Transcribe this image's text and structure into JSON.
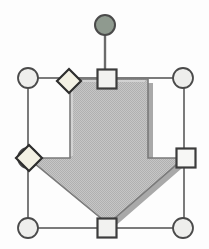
{
  "canvas": {
    "width": 209,
    "height": 249,
    "background_color": "#fdfdfd",
    "label": "drawing-canvas"
  },
  "shape": {
    "name": "down-arrow",
    "type": "autoshape",
    "state": "selected",
    "fill_color": "#bdbdbd",
    "fill_pattern": "dither-halftone-gray",
    "outline_color": "#7a7a7a",
    "shadow_color": "#8c8c8c",
    "highlight_color": "#d6d6d6",
    "geometry": {
      "bounds": {
        "x": 28,
        "y": 78,
        "width": 156,
        "height": 150
      },
      "shaft_left": 70,
      "shaft_right": 148,
      "shoulder_y": 158,
      "tip_x": 108,
      "tip_y": 224,
      "head_left": 28,
      "head_right": 184,
      "top_y": 79
    }
  },
  "selection": {
    "label": "selection-frame",
    "line_color": "#5a5a5a",
    "bounds": {
      "x": 28,
      "y": 78,
      "width": 156,
      "height": 150
    },
    "rotation_handle": {
      "name": "rotation-handle",
      "shape": "circle",
      "fill_color": "#8f9a8f",
      "outline_color": "#4a4a4a",
      "cx": 105,
      "cy": 25,
      "r": 10,
      "stem_from_y": 35,
      "stem_to_y": 79
    },
    "resize_handles": [
      {
        "name": "resize-handle-top-left",
        "shape": "circle",
        "cx": 28,
        "cy": 78,
        "r": 10,
        "fill_color": "#eeeeec",
        "outline_color": "#4a4a4a"
      },
      {
        "name": "resize-handle-top-center",
        "shape": "square",
        "cx": 107,
        "cy": 79,
        "size": 19,
        "fill_color": "#f2f2f0",
        "outline_color": "#3c3c3c"
      },
      {
        "name": "resize-handle-top-right",
        "shape": "circle",
        "cx": 183,
        "cy": 78,
        "r": 10,
        "fill_color": "#eeeeec",
        "outline_color": "#4a4a4a"
      },
      {
        "name": "resize-handle-middle-right",
        "shape": "square",
        "cx": 186,
        "cy": 158,
        "size": 19,
        "fill_color": "#f7f7f5",
        "outline_color": "#3c3c3c"
      },
      {
        "name": "resize-handle-bottom-right",
        "shape": "circle",
        "cx": 183,
        "cy": 228,
        "r": 10,
        "fill_color": "#eeeeec",
        "outline_color": "#4a4a4a"
      },
      {
        "name": "resize-handle-bottom-center",
        "shape": "square",
        "cx": 107,
        "cy": 228,
        "size": 19,
        "fill_color": "#f2f2f0",
        "outline_color": "#3c3c3c"
      },
      {
        "name": "resize-handle-bottom-left",
        "shape": "circle",
        "cx": 28,
        "cy": 228,
        "r": 10,
        "fill_color": "#eeeeec",
        "outline_color": "#4a4a4a"
      },
      {
        "name": "resize-handle-middle-left",
        "shape": "circle",
        "cx": 28,
        "cy": 158,
        "r": 10,
        "fill_color": "#eeeeec",
        "outline_color": "#4a4a4a"
      }
    ],
    "adjustment_handles": [
      {
        "name": "adjustment-handle-head-width",
        "shape": "diamond",
        "cx": 69,
        "cy": 81,
        "r": 12,
        "fill_color": "#f3f1e4",
        "outline_color": "#2e2e2e"
      },
      {
        "name": "adjustment-handle-shaft-width",
        "shape": "diamond",
        "cx": 29,
        "cy": 158,
        "r": 13,
        "fill_color": "#f3f1e4",
        "outline_color": "#2e2e2e"
      }
    ]
  }
}
